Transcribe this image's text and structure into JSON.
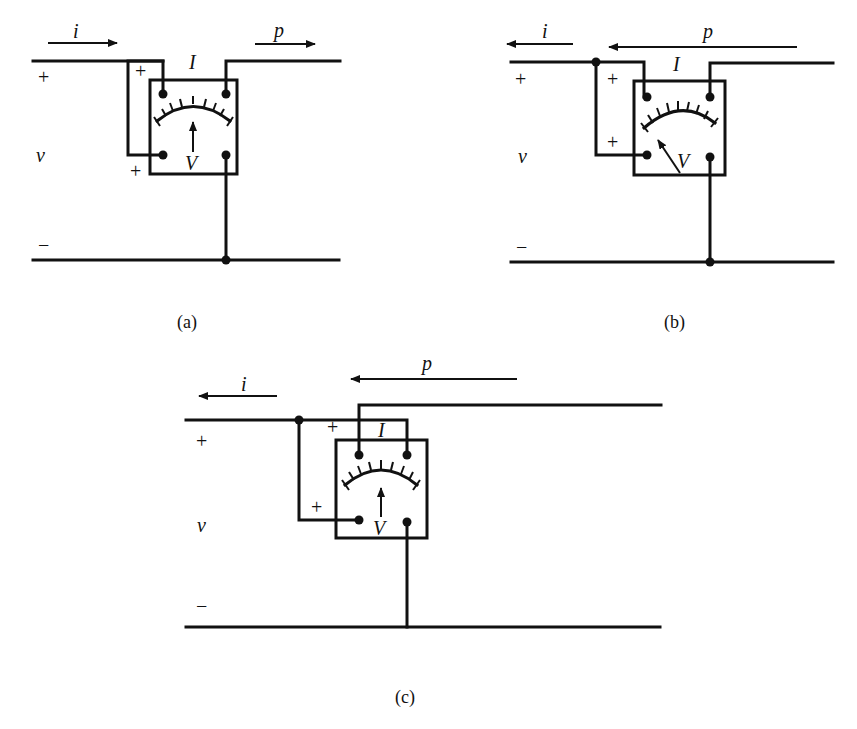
{
  "figure": {
    "colors": {
      "ink": "#111111",
      "background": "#ffffff"
    },
    "panels": [
      {
        "id": "a",
        "caption": "(a)",
        "current_label": "i",
        "current_direction": "right",
        "power_label": "p",
        "power_direction": "right",
        "meter_current_label": "I",
        "meter_voltage_label": "V",
        "voltage_label": "v",
        "plus_top": "+",
        "minus_bottom": "−",
        "terminal_plus_current": "+",
        "terminal_plus_voltage": "+",
        "needle": "center"
      },
      {
        "id": "b",
        "caption": "(b)",
        "current_label": "i",
        "current_direction": "left",
        "power_label": "p",
        "power_direction": "left",
        "meter_current_label": "I",
        "meter_voltage_label": "V",
        "voltage_label": "v",
        "plus_top": "+",
        "minus_bottom": "−",
        "terminal_plus_current": "+",
        "terminal_plus_voltage": "+",
        "needle": "deflected-left"
      },
      {
        "id": "c",
        "caption": "(c)",
        "current_label": "i",
        "current_direction": "left",
        "power_label": "p",
        "power_direction": "left",
        "meter_current_label": "I",
        "meter_voltage_label": "V",
        "voltage_label": "v",
        "plus_top": "+",
        "minus_bottom": "−",
        "terminal_plus_current": "+",
        "terminal_plus_voltage": "+",
        "needle": "center"
      }
    ]
  }
}
